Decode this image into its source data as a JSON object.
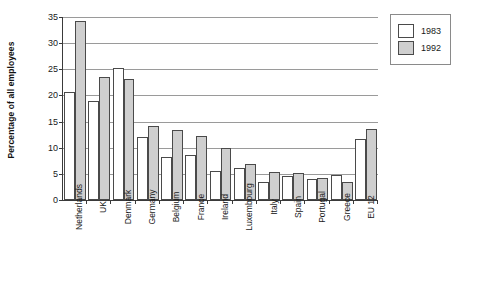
{
  "chart_data": {
    "type": "bar",
    "title": "",
    "xlabel": "",
    "ylabel": "Percentage of all employees",
    "ylim": [
      0,
      35
    ],
    "yticks": [
      0,
      5,
      10,
      15,
      20,
      25,
      30,
      35
    ],
    "ytick_labels": [
      "0",
      "5",
      "10",
      "15",
      "20",
      "25",
      "30",
      "35"
    ],
    "grid": true,
    "legend_position": "right",
    "categories": [
      "Netherlands",
      "UK",
      "Denmark",
      "Germany",
      "Belgium",
      "France",
      "Ireland",
      "Luxembourg",
      "Italy",
      "Spain",
      "Portugal",
      "Greece",
      "EU 12"
    ],
    "series": [
      {
        "name": "1983",
        "color": "#ffffff",
        "values": [
          20.7,
          19.0,
          25.2,
          12.0,
          8.3,
          8.6,
          5.6,
          6.2,
          3.4,
          4.6,
          4.1,
          4.8,
          11.6
        ]
      },
      {
        "name": "1992",
        "color": "#cfcfcf",
        "values": [
          34.2,
          23.5,
          23.1,
          14.2,
          13.3,
          12.2,
          9.9,
          6.8,
          5.3,
          5.1,
          4.3,
          3.4,
          13.6
        ]
      }
    ]
  },
  "legend": {
    "items": [
      {
        "label": "1983",
        "swatch": "white-square-swatch"
      },
      {
        "label": "1992",
        "swatch": "gray-square-swatch"
      }
    ]
  }
}
